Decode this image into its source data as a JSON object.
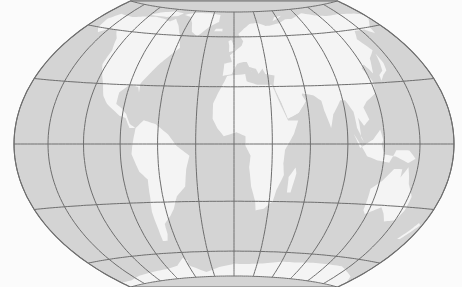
{
  "map": {
    "projection": "Wagner VII (flat-polar, world)",
    "width": 462,
    "height": 287,
    "center_x": 234,
    "equator_y": 144,
    "half_width": 220,
    "pole_y_top": 12,
    "pole_y_bottom": 279,
    "pole_line_half": 87,
    "colors": {
      "background": "#fbfbfb",
      "ocean": "#d4d4d4",
      "land": "#f4f4f4",
      "graticule": "#6e6e6e"
    },
    "graticule": {
      "meridian_step_deg": 30,
      "parallel_step_deg": 30,
      "meridians_deg": [
        -180,
        -150,
        -120,
        -90,
        -60,
        -30,
        0,
        30,
        60,
        90,
        120,
        150,
        180
      ],
      "parallels_deg": [
        -90,
        -60,
        -30,
        0,
        30,
        60,
        90
      ]
    },
    "continents": [
      {
        "name": "North America",
        "points": [
          [
            -168,
            66
          ],
          [
            -160,
            71
          ],
          [
            -140,
            70
          ],
          [
            -125,
            72
          ],
          [
            -110,
            73
          ],
          [
            -95,
            72
          ],
          [
            -85,
            70
          ],
          [
            -80,
            73
          ],
          [
            -70,
            67
          ],
          [
            -62,
            60
          ],
          [
            -56,
            52
          ],
          [
            -66,
            45
          ],
          [
            -70,
            42
          ],
          [
            -76,
            36
          ],
          [
            -81,
            31
          ],
          [
            -80,
            26
          ],
          [
            -82,
            29
          ],
          [
            -90,
            30
          ],
          [
            -97,
            26
          ],
          [
            -97,
            20
          ],
          [
            -92,
            18
          ],
          [
            -87,
            15
          ],
          [
            -83,
            10
          ],
          [
            -78,
            8
          ],
          [
            -83,
            8
          ],
          [
            -87,
            13
          ],
          [
            -92,
            14
          ],
          [
            -105,
            20
          ],
          [
            -110,
            24
          ],
          [
            -114,
            30
          ],
          [
            -118,
            34
          ],
          [
            -124,
            40
          ],
          [
            -124,
            48
          ],
          [
            -130,
            55
          ],
          [
            -140,
            60
          ],
          [
            -150,
            60
          ],
          [
            -158,
            57
          ],
          [
            -165,
            60
          ],
          [
            -168,
            66
          ]
        ]
      },
      {
        "name": "Greenland",
        "points": [
          [
            -72,
            78
          ],
          [
            -60,
            82
          ],
          [
            -35,
            83
          ],
          [
            -20,
            80
          ],
          [
            -20,
            72
          ],
          [
            -30,
            68
          ],
          [
            -42,
            60
          ],
          [
            -50,
            63
          ],
          [
            -55,
            70
          ],
          [
            -62,
            76
          ],
          [
            -72,
            78
          ]
        ]
      },
      {
        "name": "South America",
        "points": [
          [
            -78,
            8
          ],
          [
            -72,
            12
          ],
          [
            -62,
            10
          ],
          [
            -52,
            5
          ],
          [
            -45,
            -1
          ],
          [
            -35,
            -6
          ],
          [
            -38,
            -13
          ],
          [
            -40,
            -22
          ],
          [
            -48,
            -27
          ],
          [
            -53,
            -34
          ],
          [
            -58,
            -38
          ],
          [
            -65,
            -42
          ],
          [
            -66,
            -48
          ],
          [
            -69,
            -52
          ],
          [
            -74,
            -52
          ],
          [
            -73,
            -45
          ],
          [
            -73,
            -35
          ],
          [
            -71,
            -28
          ],
          [
            -70,
            -18
          ],
          [
            -76,
            -14
          ],
          [
            -81,
            -5
          ],
          [
            -80,
            0
          ],
          [
            -78,
            8
          ]
        ]
      },
      {
        "name": "Eurasia",
        "points": [
          [
            -10,
            36
          ],
          [
            -9,
            43
          ],
          [
            -2,
            44
          ],
          [
            -4,
            48
          ],
          [
            2,
            51
          ],
          [
            8,
            54
          ],
          [
            10,
            57
          ],
          [
            5,
            62
          ],
          [
            12,
            66
          ],
          [
            20,
            70
          ],
          [
            30,
            71
          ],
          [
            40,
            68
          ],
          [
            45,
            68
          ],
          [
            60,
            70
          ],
          [
            70,
            73
          ],
          [
            80,
            73
          ],
          [
            100,
            78
          ],
          [
            115,
            74
          ],
          [
            130,
            72
          ],
          [
            150,
            72
          ],
          [
            170,
            70
          ],
          [
            180,
            68
          ],
          [
            178,
            65
          ],
          [
            165,
            60
          ],
          [
            162,
            56
          ],
          [
            155,
            59
          ],
          [
            142,
            59
          ],
          [
            135,
            54
          ],
          [
            141,
            47
          ],
          [
            132,
            43
          ],
          [
            128,
            38
          ],
          [
            126,
            35
          ],
          [
            122,
            40
          ],
          [
            118,
            38
          ],
          [
            122,
            31
          ],
          [
            120,
            25
          ],
          [
            110,
            21
          ],
          [
            106,
            18
          ],
          [
            109,
            12
          ],
          [
            104,
            9
          ],
          [
            100,
            13
          ],
          [
            101,
            3
          ],
          [
            103,
            1
          ],
          [
            98,
            8
          ],
          [
            97,
            16
          ],
          [
            92,
            22
          ],
          [
            88,
            22
          ],
          [
            80,
            15
          ],
          [
            77,
            8
          ],
          [
            73,
            17
          ],
          [
            72,
            22
          ],
          [
            66,
            25
          ],
          [
            57,
            26
          ],
          [
            56,
            24
          ],
          [
            59,
            22
          ],
          [
            52,
            16
          ],
          [
            43,
            13
          ],
          [
            39,
            21
          ],
          [
            35,
            28
          ],
          [
            34,
            31
          ],
          [
            36,
            36
          ],
          [
            28,
            37
          ],
          [
            26,
            40
          ],
          [
            22,
            37
          ],
          [
            20,
            40
          ],
          [
            14,
            41
          ],
          [
            16,
            38
          ],
          [
            12,
            44
          ],
          [
            9,
            44
          ],
          [
            3,
            43
          ],
          [
            -2,
            37
          ],
          [
            -10,
            36
          ]
        ]
      },
      {
        "name": "Africa",
        "points": [
          [
            -17,
            21
          ],
          [
            -13,
            27
          ],
          [
            -9,
            32
          ],
          [
            -6,
            36
          ],
          [
            10,
            37
          ],
          [
            11,
            33
          ],
          [
            20,
            31
          ],
          [
            32,
            31
          ],
          [
            34,
            28
          ],
          [
            38,
            20
          ],
          [
            43,
            12
          ],
          [
            51,
            12
          ],
          [
            47,
            5
          ],
          [
            40,
            -3
          ],
          [
            39,
            -10
          ],
          [
            40,
            -16
          ],
          [
            35,
            -24
          ],
          [
            33,
            -30
          ],
          [
            26,
            -34
          ],
          [
            19,
            -35
          ],
          [
            18,
            -30
          ],
          [
            14,
            -22
          ],
          [
            12,
            -12
          ],
          [
            13,
            -6
          ],
          [
            9,
            -1
          ],
          [
            9,
            4
          ],
          [
            2,
            6
          ],
          [
            -8,
            4
          ],
          [
            -13,
            8
          ],
          [
            -17,
            13
          ],
          [
            -17,
            21
          ]
        ]
      },
      {
        "name": "Madagascar",
        "points": [
          [
            44,
            -25
          ],
          [
            47,
            -25
          ],
          [
            50,
            -15
          ],
          [
            49,
            -12
          ],
          [
            44,
            -17
          ],
          [
            44,
            -25
          ]
        ]
      },
      {
        "name": "Arabia",
        "points": [
          [
            35,
            28
          ],
          [
            48,
            30
          ],
          [
            56,
            26
          ],
          [
            59,
            22
          ],
          [
            52,
            16
          ],
          [
            43,
            13
          ],
          [
            39,
            21
          ],
          [
            35,
            28
          ]
        ]
      },
      {
        "name": "Australia",
        "points": [
          [
            114,
            -22
          ],
          [
            122,
            -18
          ],
          [
            130,
            -12
          ],
          [
            137,
            -12
          ],
          [
            137,
            -16
          ],
          [
            142,
            -11
          ],
          [
            146,
            -19
          ],
          [
            153,
            -25
          ],
          [
            153,
            -32
          ],
          [
            150,
            -37
          ],
          [
            140,
            -38
          ],
          [
            135,
            -34
          ],
          [
            130,
            -31
          ],
          [
            118,
            -35
          ],
          [
            115,
            -33
          ],
          [
            114,
            -22
          ]
        ]
      },
      {
        "name": "Indonesia",
        "points": [
          [
            95,
            5
          ],
          [
            106,
            -6
          ],
          [
            115,
            -8
          ],
          [
            125,
            -9
          ],
          [
            130,
            -3
          ],
          [
            141,
            -3
          ],
          [
            147,
            -7
          ],
          [
            141,
            -9
          ],
          [
            130,
            -6
          ],
          [
            120,
            -5
          ],
          [
            117,
            1
          ],
          [
            110,
            2
          ],
          [
            100,
            -2
          ],
          [
            95,
            5
          ]
        ]
      },
      {
        "name": "Borneo",
        "points": [
          [
            109,
            1
          ],
          [
            117,
            7
          ],
          [
            119,
            2
          ],
          [
            116,
            -3
          ],
          [
            110,
            -2
          ],
          [
            109,
            1
          ]
        ]
      },
      {
        "name": "Japan",
        "points": [
          [
            130,
            31
          ],
          [
            135,
            34
          ],
          [
            140,
            36
          ],
          [
            142,
            40
          ],
          [
            141,
            45
          ],
          [
            139,
            41
          ],
          [
            136,
            36
          ],
          [
            131,
            34
          ],
          [
            130,
            31
          ]
        ]
      },
      {
        "name": "Great Britain",
        "points": [
          [
            -5,
            50
          ],
          [
            1,
            51
          ],
          [
            0,
            54
          ],
          [
            -3,
            58
          ],
          [
            -6,
            57
          ],
          [
            -5,
            54
          ],
          [
            -5,
            50
          ]
        ]
      },
      {
        "name": "Iceland",
        "points": [
          [
            -24,
            64
          ],
          [
            -14,
            64
          ],
          [
            -14,
            66
          ],
          [
            -22,
            66
          ],
          [
            -24,
            64
          ]
        ]
      },
      {
        "name": "New Zealand",
        "points": [
          [
            167,
            -46
          ],
          [
            172,
            -41
          ],
          [
            175,
            -37
          ],
          [
            178,
            -38
          ],
          [
            174,
            -42
          ],
          [
            170,
            -46
          ],
          [
            167,
            -46
          ]
        ]
      },
      {
        "name": "Antarctica",
        "points": [
          [
            -180,
            -90
          ],
          [
            -180,
            -78
          ],
          [
            -160,
            -78
          ],
          [
            -140,
            -75
          ],
          [
            -110,
            -73
          ],
          [
            -90,
            -72
          ],
          [
            -75,
            -70
          ],
          [
            -62,
            -64
          ],
          [
            -58,
            -66
          ],
          [
            -60,
            -70
          ],
          [
            -40,
            -78
          ],
          [
            -20,
            -73
          ],
          [
            0,
            -70
          ],
          [
            20,
            -70
          ],
          [
            40,
            -69
          ],
          [
            60,
            -67
          ],
          [
            80,
            -67
          ],
          [
            100,
            -66
          ],
          [
            120,
            -66
          ],
          [
            140,
            -66
          ],
          [
            160,
            -70
          ],
          [
            170,
            -72
          ],
          [
            180,
            -78
          ],
          [
            180,
            -90
          ],
          [
            -180,
            -90
          ]
        ]
      },
      {
        "name": "Arctic Islands",
        "points": [
          [
            -120,
            74
          ],
          [
            -95,
            74
          ],
          [
            -80,
            76
          ],
          [
            -75,
            80
          ],
          [
            -90,
            82
          ],
          [
            -110,
            78
          ],
          [
            -120,
            74
          ]
        ]
      },
      {
        "name": "Svalbard-NovayaZemlya",
        "points": [
          [
            52,
            72
          ],
          [
            57,
            76
          ],
          [
            68,
            77
          ],
          [
            60,
            74
          ],
          [
            52,
            72
          ]
        ]
      }
    ]
  }
}
